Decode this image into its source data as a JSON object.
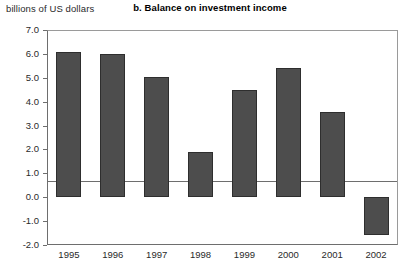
{
  "chart_data": {
    "type": "bar",
    "title": "b. Balance on investment income",
    "ylabel": "billions of US dollars",
    "xlabel": "",
    "categories": [
      "1995",
      "1996",
      "1997",
      "1998",
      "1999",
      "2000",
      "2001",
      "2002"
    ],
    "values": [
      6.1,
      6.0,
      5.05,
      1.9,
      4.5,
      5.4,
      3.55,
      -1.6
    ],
    "ylim": [
      -2.0,
      7.0
    ],
    "ytick_labels": [
      "7.0",
      "6.0",
      "5.0",
      "4.0",
      "3.0",
      "2.0",
      "1.0",
      "0.0",
      "-1.0",
      "-2.0"
    ],
    "ytick_values": [
      7.0,
      6.0,
      5.0,
      4.0,
      3.0,
      2.0,
      1.0,
      0.0,
      -1.0,
      -2.0
    ],
    "grid": false,
    "legend": null,
    "bar_color": "#4d4d4d",
    "bar_edge_color": "#2e2e2e",
    "axis_color": "#6e6e6e",
    "background_color": "#ffffff"
  }
}
